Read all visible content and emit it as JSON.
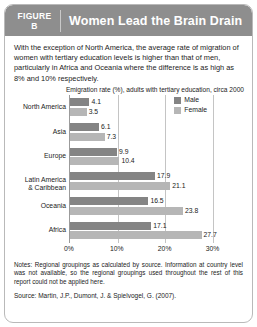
{
  "header": {
    "figure_word": "FIGURE",
    "figure_letter": "B",
    "title": "Women Lead the Brain Drain",
    "background_color": "#8e8e8e",
    "text_color": "#ffffff"
  },
  "intro": {
    "text": "With the exception of North America, the average rate of migration of women with tertiary education levels is higher than that of men, particularly in Africa and Oceania where the difference is as high as 8% and 10% respectively."
  },
  "legend": {
    "items": [
      {
        "label": "Male",
        "color": "#848484"
      },
      {
        "label": "Female",
        "color": "#b6b6b6"
      }
    ]
  },
  "notes": {
    "notes_text": "Notes: Regional groupings as calculated by source. Information at country level was not available, so the regional groupings used throughout the rest of this report could not be applied here.",
    "source_text": "Source: Martin, J.P., Dumont, J. & Spielvogel, G. (2007)."
  },
  "chart_data": {
    "type": "bar",
    "orientation": "horizontal",
    "title": "Emigration rate (%), adults with tertiary education, circa 2000",
    "xlabel": "",
    "ylabel": "",
    "xlim": [
      0,
      32
    ],
    "xticks": [
      0,
      10,
      20,
      30
    ],
    "xticklabels": [
      "0%",
      "10%",
      "20%",
      "30%"
    ],
    "grid": true,
    "legend_position": "top-right",
    "categories": [
      "North America",
      "Asia",
      "Europe",
      "Latin America & Caribbean",
      "Oceania",
      "Africa"
    ],
    "series": [
      {
        "name": "Male",
        "color": "#848484",
        "values": [
          4.1,
          6.1,
          9.9,
          17.9,
          16.5,
          17.1
        ],
        "labels": [
          "4.1",
          "6.1",
          "9.9",
          "17.9",
          "16.5",
          "17.1"
        ]
      },
      {
        "name": "Female",
        "color": "#b6b6b6",
        "values": [
          3.5,
          7.3,
          10.4,
          21.1,
          23.8,
          27.7
        ],
        "labels": [
          "3.5",
          "7.3",
          "10.4",
          "21.1",
          "23.8",
          "27.7"
        ]
      }
    ]
  }
}
